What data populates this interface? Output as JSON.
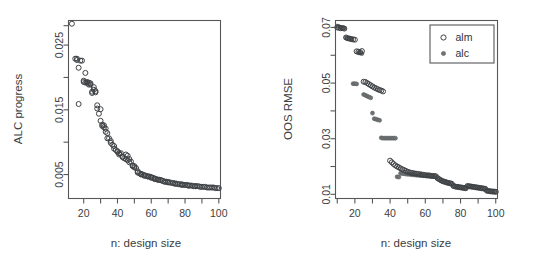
{
  "figure": {
    "background": "#ffffff",
    "panel_count": 2
  },
  "chart_data": [
    {
      "type": "scatter",
      "panel": "left",
      "title": "",
      "xlabel": "n: design size",
      "ylabel": "ALC progress",
      "xlim": [
        11,
        101
      ],
      "ylim": [
        0.0013,
        0.0288
      ],
      "grid": false,
      "legend": null,
      "xticks": [
        20,
        40,
        60,
        80,
        100
      ],
      "xticklabels": [
        "20",
        "40",
        "60",
        "80",
        "100"
      ],
      "xminorticks": [
        10,
        30,
        50,
        70,
        90
      ],
      "yticks": [
        0.005,
        0.015,
        0.025
      ],
      "yticklabels": [
        "0.005",
        "0.015",
        "0.025"
      ],
      "yminorticks": [
        0.01,
        0.02,
        0.028
      ],
      "series": [
        {
          "name": "alm",
          "marker": "open-circle",
          "color": "#3f4245",
          "x": [
            13,
            15,
            16,
            16,
            17,
            17,
            18,
            19,
            20,
            20,
            21,
            21,
            22,
            22,
            23,
            23,
            24,
            24,
            25,
            25,
            26,
            26,
            27,
            27,
            28,
            28,
            29,
            30,
            30,
            31,
            31,
            32,
            32,
            33,
            33,
            34,
            34,
            35,
            36,
            36,
            37,
            38,
            38,
            39,
            40,
            40,
            41,
            41,
            42,
            43,
            43,
            44,
            45,
            45,
            46,
            46,
            47,
            47,
            48,
            49,
            49,
            50,
            50,
            51,
            52,
            52,
            53,
            54,
            54,
            55,
            56,
            56,
            57,
            58,
            58,
            59,
            60,
            60,
            61,
            62,
            62,
            63,
            64,
            64,
            65,
            66,
            66,
            67,
            68,
            68,
            69,
            70,
            70,
            71,
            72,
            73,
            74,
            74,
            75,
            76,
            77,
            78,
            78,
            79,
            80,
            81,
            82,
            82,
            83,
            84,
            85,
            86,
            86,
            87,
            88,
            89,
            90,
            91,
            92,
            93,
            94,
            95,
            96,
            97,
            98,
            99,
            100
          ],
          "y": [
            0.0283,
            0.0229,
            0.0229,
            0.0227,
            0.0215,
            0.0159,
            0.0226,
            0.0226,
            0.0195,
            0.0193,
            0.0207,
            0.0192,
            0.0193,
            0.0192,
            0.0192,
            0.0189,
            0.0191,
            0.0189,
            0.0178,
            0.0176,
            0.0185,
            0.0181,
            0.0179,
            0.0177,
            0.0157,
            0.0152,
            0.0144,
            0.0151,
            0.0133,
            0.0127,
            0.0125,
            0.0126,
            0.0123,
            0.0121,
            0.0116,
            0.0114,
            0.0106,
            0.0106,
            0.0102,
            0.0099,
            0.0096,
            0.0094,
            0.009,
            0.0088,
            0.0086,
            0.0085,
            0.0083,
            0.0081,
            0.0083,
            0.0078,
            0.0077,
            0.0075,
            0.0081,
            0.0074,
            0.0079,
            0.0072,
            0.0074,
            0.0069,
            0.007,
            0.0064,
            0.0063,
            0.0063,
            0.0061,
            0.006,
            0.0055,
            0.0053,
            0.0052,
            0.0051,
            0.005,
            0.005,
            0.0049,
            0.0048,
            0.0048,
            0.0047,
            0.0047,
            0.0047,
            0.0046,
            0.0045,
            0.0045,
            0.0044,
            0.0043,
            0.0043,
            0.0042,
            0.0042,
            0.0042,
            0.0041,
            0.0041,
            0.004,
            0.0039,
            0.0039,
            0.0039,
            0.0038,
            0.0038,
            0.0038,
            0.0037,
            0.0037,
            0.0036,
            0.0036,
            0.0036,
            0.0035,
            0.0035,
            0.0035,
            0.0034,
            0.0034,
            0.0034,
            0.0034,
            0.0033,
            0.0033,
            0.0033,
            0.0033,
            0.0032,
            0.0032,
            0.0032,
            0.0032,
            0.0032,
            0.0031,
            0.0031,
            0.0031,
            0.0031,
            0.003,
            0.003,
            0.003,
            0.003,
            0.003,
            0.0029,
            0.0029,
            0.0029
          ]
        }
      ]
    },
    {
      "type": "scatter",
      "panel": "right",
      "title": "",
      "xlabel": "n: design size",
      "ylabel": "OOS RMSE",
      "xlim": [
        9,
        101
      ],
      "ylim": [
        0.0085,
        0.0725
      ],
      "grid": false,
      "legend": {
        "position": "top-right",
        "entries": [
          {
            "label": "alm",
            "marker": "open-circle"
          },
          {
            "label": "alc",
            "marker": "filled-circle"
          }
        ]
      },
      "xticks": [
        20,
        40,
        60,
        80,
        100
      ],
      "xticklabels": [
        "20",
        "40",
        "60",
        "80",
        "100"
      ],
      "xminorticks": [
        10,
        30,
        50,
        70,
        90
      ],
      "yticks": [
        0.01,
        0.03,
        0.05,
        0.07
      ],
      "yticklabels": [
        "0.01",
        "0.03",
        "0.05",
        "0.07"
      ],
      "yminorticks": [
        0.02,
        0.04,
        0.06
      ],
      "series": [
        {
          "name": "alm",
          "marker": "open-circle",
          "color": "#3f4245",
          "x": [
            10,
            11,
            12,
            13,
            14,
            15,
            16,
            17,
            18,
            19,
            20,
            21,
            22,
            23,
            24,
            25,
            26,
            27,
            28,
            29,
            30,
            31,
            32,
            33,
            34,
            35,
            36,
            40,
            41,
            42,
            43,
            44,
            45,
            46,
            47,
            48,
            49,
            50,
            51,
            52,
            53,
            54,
            55,
            56,
            57,
            58,
            59,
            60,
            61,
            62,
            63,
            64,
            65,
            66,
            67,
            68,
            69,
            70,
            71,
            72,
            73,
            74,
            75,
            76,
            77,
            78,
            79,
            80,
            81,
            82,
            83,
            84,
            85,
            86,
            87,
            88,
            89,
            90,
            91,
            92,
            93,
            94,
            95,
            96,
            97,
            98,
            99,
            100
          ],
          "y": [
            0.07,
            0.0699,
            0.0697,
            0.0698,
            0.0696,
            0.0664,
            0.0661,
            0.066,
            0.0658,
            0.0657,
            0.0656,
            0.0614,
            0.0613,
            0.0611,
            0.0615,
            0.0505,
            0.0504,
            0.05,
            0.0496,
            0.0492,
            0.0488,
            0.0484,
            0.0481,
            0.0478,
            0.0475,
            0.0473,
            0.047,
            0.0221,
            0.0215,
            0.0209,
            0.0204,
            0.02,
            0.0197,
            0.0193,
            0.019,
            0.0187,
            0.0184,
            0.0181,
            0.0179,
            0.0177,
            0.0176,
            0.0175,
            0.0174,
            0.0173,
            0.0172,
            0.0171,
            0.017,
            0.0169,
            0.0168,
            0.0168,
            0.0167,
            0.0166,
            0.0166,
            0.0165,
            0.0158,
            0.0154,
            0.015,
            0.0147,
            0.0145,
            0.0143,
            0.0141,
            0.014,
            0.0138,
            0.013,
            0.0128,
            0.0127,
            0.0126,
            0.0125,
            0.0124,
            0.0123,
            0.0122,
            0.013,
            0.0129,
            0.0128,
            0.0127,
            0.0126,
            0.0125,
            0.0124,
            0.0123,
            0.0122,
            0.0121,
            0.012,
            0.0113,
            0.0112,
            0.0111,
            0.011,
            0.011,
            0.0109,
            0.0108
          ]
        },
        {
          "name": "alc",
          "marker": "filled-circle",
          "color": "#6f7376",
          "x": [
            10,
            11,
            12,
            13,
            14,
            15,
            16,
            17,
            18,
            19,
            20,
            21,
            22,
            23,
            24,
            25,
            26,
            27,
            28,
            29,
            30,
            31,
            32,
            33,
            34,
            35,
            36,
            37,
            38,
            39,
            40,
            41,
            42,
            43,
            44,
            45,
            46,
            47,
            48,
            49,
            50,
            51,
            52,
            53,
            54,
            55,
            56,
            57,
            58,
            59,
            60,
            61,
            62,
            63,
            64,
            65,
            66,
            67,
            68,
            69,
            70,
            71,
            72,
            73,
            74,
            75,
            76,
            77,
            78,
            79,
            80,
            81,
            82,
            83,
            84,
            85,
            86,
            87,
            88,
            89,
            90,
            91,
            92,
            93,
            94,
            95,
            96,
            97,
            98,
            99,
            100
          ],
          "y": [
            0.0705,
            0.0703,
            0.07,
            0.0698,
            0.0696,
            0.0663,
            0.0661,
            0.066,
            0.0659,
            0.0498,
            0.0498,
            0.0497,
            0.0609,
            0.0608,
            0.0606,
            0.0459,
            0.0456,
            0.0453,
            0.045,
            0.0447,
            0.0392,
            0.0372,
            0.037,
            0.0368,
            0.0366,
            0.0303,
            0.0302,
            0.0302,
            0.0302,
            0.0302,
            0.0302,
            0.0302,
            0.0302,
            0.0302,
            0.0163,
            0.0162,
            0.0176,
            0.0175,
            0.0174,
            0.0173,
            0.0172,
            0.0172,
            0.0171,
            0.017,
            0.017,
            0.0169,
            0.0169,
            0.0168,
            0.0168,
            0.0167,
            0.0167,
            0.0166,
            0.0166,
            0.0165,
            0.0165,
            0.0164,
            0.0164,
            0.0157,
            0.0153,
            0.015,
            0.0147,
            0.0145,
            0.0143,
            0.0141,
            0.0139,
            0.0137,
            0.013,
            0.0128,
            0.0127,
            0.0126,
            0.0125,
            0.0124,
            0.0123,
            0.0122,
            0.013,
            0.0129,
            0.0128,
            0.0127,
            0.0126,
            0.0125,
            0.0124,
            0.0123,
            0.0122,
            0.0121,
            0.012,
            0.0113,
            0.0112,
            0.0111,
            0.011,
            0.0109,
            0.0108
          ]
        }
      ]
    }
  ]
}
